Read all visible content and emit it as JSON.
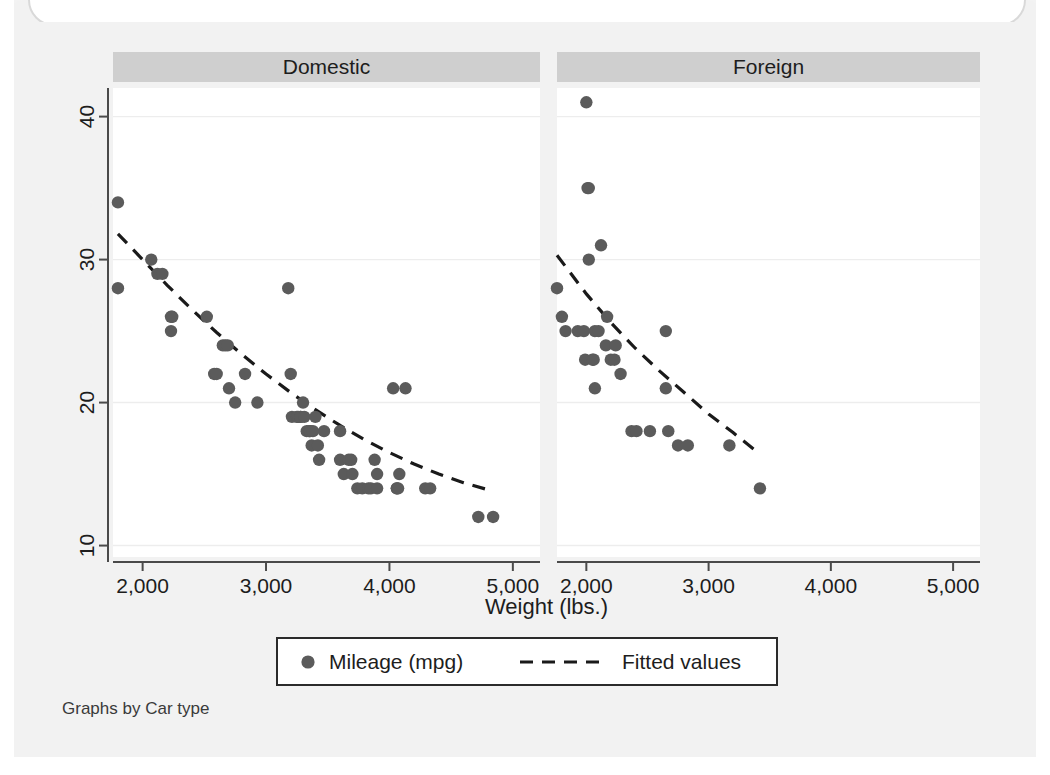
{
  "figure": {
    "background_color": "#f2f2f2",
    "plot_background_color": "#ffffff",
    "note": "Graphs by Car type",
    "panel_header_color": "#cfcfcf",
    "marker_color": "#5b5b5b",
    "line_color": "#1a1a1a",
    "grid_color": "#ededed",
    "axis_color": "#4a4a4a"
  },
  "chart_data": {
    "type": "scatter",
    "title": "",
    "subtitle": "",
    "xlabel": "Weight (lbs.)",
    "ylabel": "",
    "xlim": [
      1760,
      5220
    ],
    "ylim": [
      9.2,
      42.0
    ],
    "xticks": [
      2000,
      3000,
      4000,
      5000
    ],
    "xtick_labels": [
      "2,000",
      "3,000",
      "4,000",
      "5,000"
    ],
    "yticks": [
      10,
      20,
      30,
      40
    ],
    "ytick_labels": [
      "10",
      "20",
      "30",
      "40"
    ],
    "grid": "horizontal",
    "legend_position": "bottom",
    "legend": [
      {
        "label": "Mileage (mpg)",
        "marker": "circle",
        "color": "#5b5b5b"
      },
      {
        "label": "Fitted values",
        "marker": "dashed-line",
        "color": "#1a1a1a"
      }
    ],
    "facet_by": "Car type",
    "panels": [
      {
        "name": "Domestic",
        "scatter": {
          "name": "Mileage (mpg)",
          "x": [
            1800,
            1800,
            2070,
            2120,
            2160,
            2230,
            2230,
            2240,
            2520,
            2580,
            2600,
            2650,
            2670,
            2690,
            2700,
            2750,
            2830,
            2930,
            3180,
            3200,
            3210,
            3250,
            3260,
            3280,
            3280,
            3300,
            3310,
            3330,
            3350,
            3350,
            3360,
            3370,
            3380,
            3400,
            3420,
            3430,
            3470,
            3600,
            3600,
            3630,
            3670,
            3690,
            3700,
            3740,
            3780,
            3830,
            3850,
            3880,
            3900,
            3900,
            4030,
            4060,
            4060,
            4070,
            4080,
            4130,
            4290,
            4330,
            4720,
            4840
          ],
          "y": [
            34,
            28,
            30,
            29,
            29,
            26,
            25,
            26,
            26,
            22,
            22,
            24,
            24,
            24,
            21,
            20,
            22,
            20,
            28,
            22,
            19,
            19,
            19,
            19,
            19,
            20,
            19,
            18,
            18,
            18,
            18,
            17,
            18,
            19,
            17,
            16,
            18,
            18,
            16,
            15,
            16,
            16,
            15,
            14,
            14,
            14,
            14,
            16,
            14,
            15,
            21,
            14,
            14,
            14,
            15,
            21,
            14,
            14,
            12,
            12
          ]
        },
        "fitted": {
          "name": "Fitted values",
          "x": [
            1800,
            2000,
            2200,
            2400,
            2600,
            2800,
            3000,
            3200,
            3400,
            3600,
            3800,
            4000,
            4200,
            4400,
            4600,
            4840
          ],
          "y": [
            31.8,
            30.0,
            28.2,
            26.5,
            24.9,
            23.4,
            22.0,
            20.7,
            19.5,
            18.4,
            17.4,
            16.5,
            15.7,
            15.0,
            14.4,
            13.8
          ]
        }
      },
      {
        "name": "Foreign",
        "scatter": {
          "name": "Mileage (mpg)",
          "x": [
            1760,
            1800,
            1830,
            1930,
            1980,
            1990,
            2000,
            2010,
            2020,
            2020,
            2050,
            2060,
            2070,
            2070,
            2100,
            2120,
            2160,
            2170,
            2200,
            2230,
            2240,
            2280,
            2370,
            2410,
            2520,
            2650,
            2650,
            2670,
            2750,
            2830,
            3170,
            3420
          ],
          "y": [
            28,
            26,
            25,
            25,
            25,
            23,
            41,
            35,
            35,
            30,
            23,
            23,
            25,
            21,
            25,
            31,
            24,
            26,
            23,
            23,
            24,
            22,
            18,
            18,
            18,
            25,
            21,
            18,
            17,
            17,
            17,
            14
          ]
        },
        "fitted": {
          "name": "Fitted values",
          "x": [
            1760,
            2000,
            2200,
            2400,
            2600,
            2800,
            3000,
            3200,
            3420
          ],
          "y": [
            30.3,
            27.6,
            25.6,
            23.8,
            22.2,
            20.7,
            19.2,
            17.9,
            16.4
          ]
        }
      }
    ]
  }
}
